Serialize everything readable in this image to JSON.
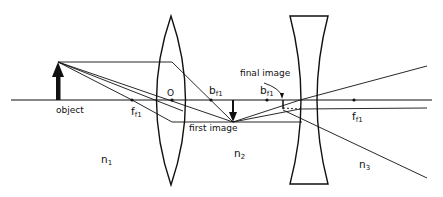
{
  "diagram": {
    "type": "optical ray diagram",
    "colors": {
      "ink": "#111111",
      "background": "#ffffff"
    },
    "labels": {
      "object": "object",
      "center": "O",
      "first_image": "first image",
      "final_image": "final image",
      "b1_main": "b",
      "b1_sub": "f1",
      "f1_main": "f",
      "f1_sub": "f1",
      "b2_main": "b",
      "b2_sub": "f1",
      "f2_main": "f",
      "f2_sub": "f1",
      "n1_main": "n",
      "n1_sub": "1",
      "n2_main": "n",
      "n2_sub": "2",
      "n3_main": "n",
      "n3_sub": "3"
    },
    "elements": {
      "optical_axis": "horizontal line",
      "lens_1": "biconvex lens",
      "lens_2": "biconcave lens"
    }
  }
}
